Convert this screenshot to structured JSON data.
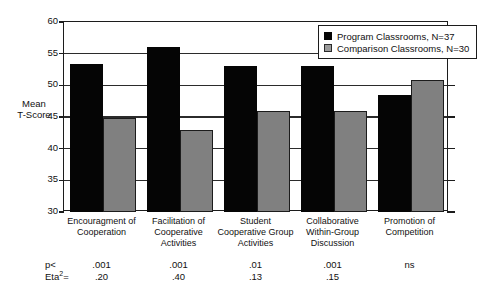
{
  "chart_data": {
    "type": "bar",
    "title": "",
    "xlabel": "",
    "ylabel": "Mean T-Score",
    "ylim": [
      30,
      60
    ],
    "yticks": [
      30,
      35,
      40,
      45,
      50,
      55,
      60
    ],
    "ytick_labels": [
      "30",
      "35",
      "40",
      "45",
      "50",
      "55",
      "60"
    ],
    "grid": true,
    "legend_position": "top-right",
    "categories": [
      "Encouragment of Cooperation",
      "Facilitation of Cooperative Activities",
      "Student Cooperative Group Activities",
      "Collaborative Within-Group Discussion",
      "Promotion of Competition"
    ],
    "category_lines": [
      [
        "Encouragment of",
        "Cooperation"
      ],
      [
        "Facilitation of",
        "Cooperative",
        "Activities"
      ],
      [
        "Student",
        "Cooperative Group",
        "Activities"
      ],
      [
        "Collaborative",
        "Within-Group",
        "Discussion"
      ],
      [
        "Promotion of",
        "Competition"
      ]
    ],
    "series": [
      {
        "name": "Program Classrooms, N=37",
        "color": "#050505",
        "values": [
          53.3,
          56.0,
          53.1,
          53.0,
          48.4
        ]
      },
      {
        "name": "Comparison Classrooms, N=30",
        "color": "#808080",
        "values": [
          44.9,
          43.0,
          46.0,
          45.9,
          50.9
        ]
      }
    ],
    "annotations": {
      "p_row_label": "p<",
      "eta_row_label": "Eta",
      "eta_row_label_sup": "2",
      "eta_row_label_suffix": "=",
      "p_values": [
        ".001",
        ".001",
        ".01",
        ".001",
        "ns"
      ],
      "eta_values": [
        ".20",
        ".40",
        ".13",
        ".15",
        ""
      ]
    }
  },
  "axis": {
    "ylabel_line1": "Mean",
    "ylabel_line2": "T-Score"
  },
  "legend": {
    "items": [
      {
        "label": "Program Classrooms, N=37",
        "swatch": "black-square-swatch"
      },
      {
        "label": "Comparison Classrooms, N=30",
        "swatch": "gray-square-swatch"
      }
    ]
  },
  "colors": {
    "program": "#050505",
    "comparison": "#808080",
    "axis": "#1c1c1c",
    "background": "#ffffff"
  }
}
